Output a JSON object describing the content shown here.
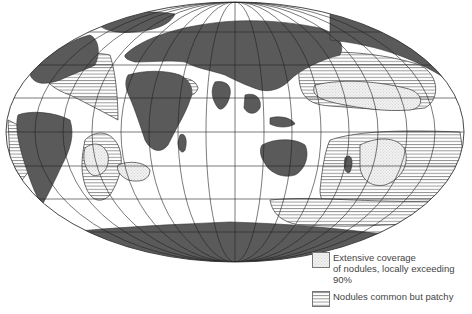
{
  "map": {
    "projection": "Mollweide (world, Indian Ocean centered)",
    "colors": {
      "land": "#5a5a5a",
      "ocean": "#ffffff",
      "outline": "#333333",
      "graticule": "#222222",
      "extensive_fill": "#eeeeee",
      "hatch": "#555555"
    }
  },
  "legend": {
    "items": [
      {
        "id": "extensive",
        "label": "Extensive coverage\nof nodules, locally exceeding 90%",
        "pattern": "dotted"
      },
      {
        "id": "patchy",
        "label": "Nodules common but patchy",
        "pattern": "horizontal-lines"
      }
    ]
  }
}
